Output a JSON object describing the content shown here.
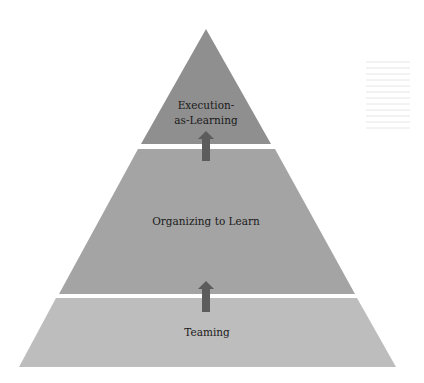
{
  "diagram": {
    "type": "pyramid",
    "tiers": [
      {
        "id": "top",
        "label_lines": [
          "Execution-",
          "as-Learning"
        ],
        "color": "#8f8f8f"
      },
      {
        "id": "middle",
        "label_lines": [
          "Organizing to Learn"
        ],
        "color": "#a4a4a4"
      },
      {
        "id": "bottom",
        "label_lines": [
          "Teaming"
        ],
        "color": "#bdbdbd"
      }
    ],
    "arrows": [
      {
        "from": "bottom",
        "to": "middle",
        "direction": "up",
        "color": "#5c5c5c"
      },
      {
        "from": "middle",
        "to": "top",
        "direction": "up",
        "color": "#5c5c5c"
      }
    ],
    "separator_color": "#ffffff"
  }
}
